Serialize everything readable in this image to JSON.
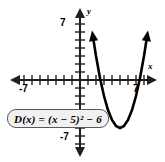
{
  "figure": {
    "equation_label": "D(x) = (x − 5)² − 6",
    "axis_labels": {
      "x": "x",
      "y": "y"
    },
    "tick_labels": {
      "x_negative": "-7",
      "x_positive": "7",
      "y_positive": "7",
      "y_negative": "-7"
    },
    "colors": {
      "curve": "#000000",
      "axis": "#231f20",
      "box_border": "#58595b",
      "box_fill": "#f1f1f2",
      "background": "#ffffff"
    }
  },
  "chart_data": {
    "type": "line",
    "title": "",
    "subtitle": "",
    "xlabel": "x",
    "ylabel": "y",
    "xlim": [
      -8,
      9
    ],
    "ylim": [
      -8,
      8
    ],
    "xticks": [
      -7,
      -6,
      -5,
      -4,
      -3,
      -2,
      -1,
      0,
      1,
      2,
      3,
      4,
      5,
      6,
      7,
      8
    ],
    "yticks": [
      -7,
      -6,
      -5,
      -4,
      -3,
      -2,
      -1,
      0,
      1,
      2,
      3,
      4,
      5,
      6,
      7
    ],
    "xtick_labels_shown": [
      "-7",
      "7"
    ],
    "ytick_labels_shown": [
      "7",
      "-7"
    ],
    "grid": false,
    "legend": false,
    "annotations": [
      "D(x) = (x − 5)² − 6"
    ],
    "series": [
      {
        "name": "D(x) = (x - 5)^2 - 6",
        "function": "(x-5)^2-6",
        "vertex": [
          5,
          -6
        ],
        "x_intercepts": [
          2.551,
          7.449
        ],
        "y_intercept": 19,
        "x": [
          1.6,
          2.0,
          2.5,
          3.0,
          3.5,
          4.0,
          4.5,
          5.0,
          5.5,
          6.0,
          6.5,
          7.0,
          7.5,
          8.0,
          8.4
        ],
        "y": [
          5.56,
          3.0,
          0.25,
          -2.0,
          -3.75,
          -5.0,
          -5.75,
          -6.0,
          -5.75,
          -5.0,
          -3.75,
          -2.0,
          0.25,
          3.0,
          5.56
        ]
      }
    ]
  }
}
